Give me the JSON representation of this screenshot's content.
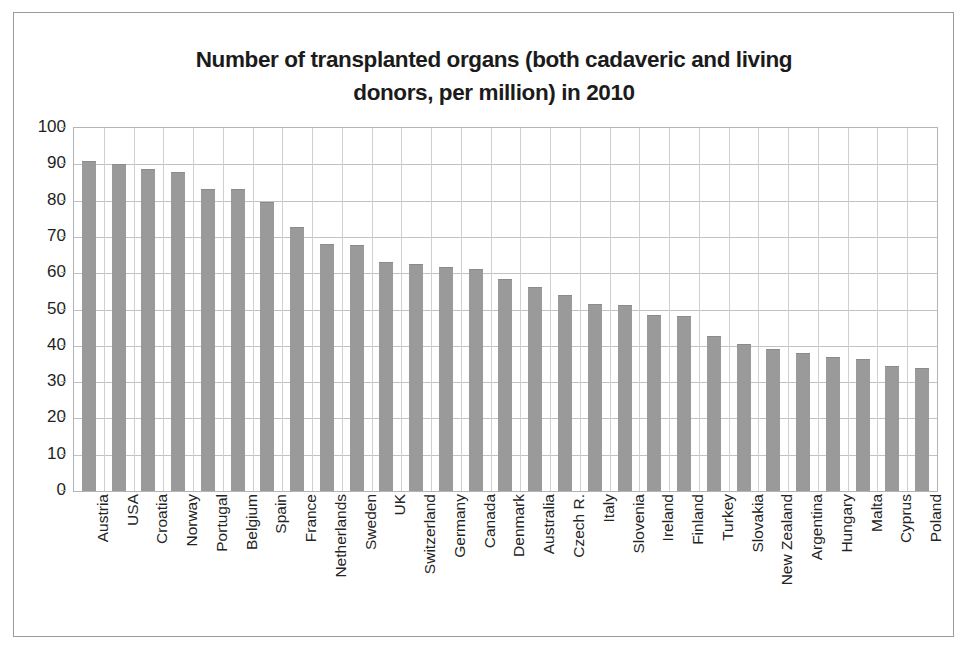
{
  "chart_data": {
    "type": "bar",
    "title": "Number of transplanted organs (both cadaveric and living donors, per million) in 2010",
    "title_line1": "Number of transplanted organs (both cadaveric and living",
    "title_line2": "donors, per million) in 2010",
    "xlabel": "",
    "ylabel": "",
    "ylim": [
      0,
      100
    ],
    "ytick_step": 10,
    "yticks": [
      "100",
      "90",
      "80",
      "70",
      "60",
      "50",
      "40",
      "30",
      "20",
      "10",
      "0"
    ],
    "grid": true,
    "legend": "none",
    "bar_color": "#9a9a9a",
    "plot_border_color": "#b4b4b4",
    "gridline_color": "#c2c2c2",
    "categories": [
      "Austria",
      "USA",
      "Croatia",
      "Norway",
      "Portugal",
      "Belgium",
      "Spain",
      "France",
      "Netherlands",
      "Sweden",
      "UK",
      "Switzerland",
      "Germany",
      "Canada",
      "Denmark",
      "Australia",
      "Czech R.",
      "Italy",
      "Slovenia",
      "Ireland",
      "Finland",
      "Turkey",
      "Slovakia",
      "New Zealand",
      "Argentina",
      "Hungary",
      "Malta",
      "Cyprus",
      "Poland"
    ],
    "values": [
      90.8,
      90.0,
      88.6,
      88.0,
      83.3,
      83.1,
      79.6,
      72.6,
      68.0,
      67.9,
      63.0,
      62.6,
      61.6,
      61.2,
      58.5,
      56.2,
      53.9,
      51.6,
      51.2,
      48.4,
      48.3,
      42.8,
      40.6,
      39.2,
      38.0,
      37.0,
      36.4,
      34.4,
      33.9
    ]
  }
}
